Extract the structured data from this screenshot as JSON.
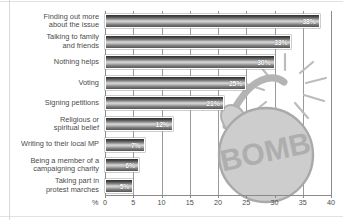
{
  "chart_data": {
    "type": "bar",
    "orientation": "horizontal",
    "title": "",
    "subtitle": "",
    "xlabel": "%",
    "ylabel": "",
    "xlim": [
      0,
      40
    ],
    "xticks": [
      0,
      5,
      10,
      15,
      20,
      25,
      30,
      35,
      40
    ],
    "xtick_labels": [
      "0",
      "5",
      "10",
      "15",
      "20",
      "25",
      "30",
      "35",
      "40"
    ],
    "grid": true,
    "legend": false,
    "categories": [
      "Finding out more\nabout the issue",
      "Talking to family\nand friends",
      "Nothing helps",
      "Voting",
      "Signing petitions",
      "Religious or\nspiritual belief",
      "Writing to their local MP",
      "Being a member of a\ncampaigning charity",
      "Taking part in\nprotest marches"
    ],
    "values": [
      38,
      33,
      30,
      25,
      21,
      12,
      7,
      6,
      5
    ],
    "value_labels": [
      "38%",
      "33%",
      "30%",
      "25%",
      "21%",
      "12%",
      "7%",
      "6%",
      "5%"
    ],
    "annotations": [
      {
        "name": "bomb-watermark",
        "text": "BOMB",
        "description": "cartoon bomb watermark with lit fuse and spark lines"
      }
    ]
  },
  "colors": {
    "bar_dark": "#2f2f2f",
    "bar_light": "#d9d9d9",
    "bar_border": "#ffffff",
    "axis": "#8a8a8a",
    "text": "#4b4b4b",
    "value_text": "#ffffff",
    "watermark": "#bdbdbd",
    "background": "#ffffff"
  },
  "axis": {
    "percent_symbol": "%"
  }
}
